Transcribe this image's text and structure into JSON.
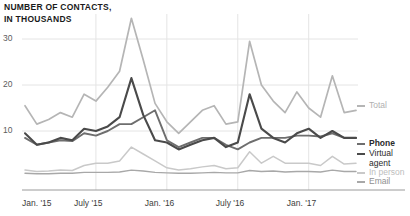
{
  "chart_data": {
    "type": "line",
    "title": "NUMBER OF CONTACTS,\nIN THOUSANDS",
    "xlabel": "",
    "ylabel": "",
    "grid": true,
    "legend_position": "right",
    "ylim": [
      0,
      36
    ],
    "yticks": [
      10,
      20,
      30
    ],
    "ytick_labels": [
      "10",
      "20",
      "30"
    ],
    "xtick_labels": [
      "Jan. '15",
      "July '15",
      "Jan. '16",
      "July '16",
      "Jan. '17"
    ],
    "xtick_indices": [
      0,
      6,
      12,
      18,
      24
    ],
    "x": [
      "Jan. '15",
      "Feb. '15",
      "Mar. '15",
      "Apr. '15",
      "May '15",
      "June '15",
      "July '15",
      "Aug. '15",
      "Sept. '15",
      "Oct. '15",
      "Nov. '15",
      "Dec. '15",
      "Jan. '16",
      "Feb. '16",
      "Mar. '16",
      "Apr. '16",
      "May '16",
      "June '16",
      "July '16",
      "Aug. '16",
      "Sept. '16",
      "Oct. '16",
      "Nov. '16",
      "Dec. '16",
      "Jan. '17",
      "Feb. '17",
      "Mar. '17",
      "Apr. '17",
      "May '17"
    ],
    "series": [
      {
        "name": "Total",
        "color": "#b5b5b5",
        "width": 1.7,
        "values": [
          15.5,
          11.5,
          12.5,
          14.0,
          13.0,
          18.0,
          16.5,
          19.5,
          23.0,
          34.5,
          25.5,
          16.0,
          12.0,
          9.5,
          12.0,
          14.5,
          15.5,
          11.5,
          12.0,
          29.5,
          20.0,
          16.5,
          14.0,
          18.5,
          15.0,
          13.0,
          22.0,
          14.0,
          14.5
        ]
      },
      {
        "name": "Phone",
        "color": "#6e6e6e",
        "width": 1.9,
        "values": [
          8.5,
          7.0,
          7.5,
          8.0,
          7.8,
          9.5,
          9.0,
          10.0,
          11.5,
          11.5,
          13.0,
          14.5,
          8.0,
          6.5,
          7.5,
          8.5,
          8.5,
          7.0,
          6.0,
          7.5,
          8.5,
          8.5,
          8.5,
          9.0,
          9.0,
          8.8,
          9.5,
          8.5,
          8.5
        ]
      },
      {
        "name": "Virtual\nagent",
        "color": "#4a4a4a",
        "width": 2.1,
        "values": [
          9.5,
          7.0,
          7.5,
          8.5,
          8.0,
          10.5,
          10.0,
          11.0,
          13.0,
          21.5,
          13.5,
          8.0,
          7.5,
          6.0,
          7.0,
          8.0,
          8.5,
          6.5,
          7.5,
          18.0,
          10.5,
          8.5,
          7.5,
          9.5,
          10.5,
          8.5,
          10.0,
          8.5,
          8.5
        ]
      },
      {
        "name": "In person",
        "color": "#c9c9c9",
        "width": 1.5,
        "values": [
          1.5,
          1.2,
          1.3,
          1.5,
          1.4,
          2.5,
          3.0,
          3.0,
          3.5,
          6.5,
          5.0,
          3.5,
          2.0,
          1.5,
          1.8,
          2.2,
          2.5,
          1.8,
          2.0,
          5.5,
          3.0,
          4.5,
          3.0,
          3.0,
          3.0,
          2.5,
          4.5,
          2.8,
          3.0
        ]
      },
      {
        "name": "Email",
        "color": "#a8a8a8",
        "width": 1.4,
        "values": [
          0.8,
          0.7,
          0.7,
          0.8,
          0.8,
          1.0,
          1.0,
          1.0,
          1.1,
          1.5,
          1.3,
          1.0,
          0.9,
          0.8,
          0.8,
          0.9,
          1.0,
          0.9,
          0.9,
          1.4,
          1.2,
          1.3,
          1.1,
          1.2,
          1.2,
          1.1,
          1.5,
          1.2,
          1.2
        ]
      }
    ]
  },
  "legend": {
    "items": [
      {
        "label": "Total",
        "color": "#b5b5b5"
      },
      {
        "label": "Phone",
        "color": "#6e6e6e"
      },
      {
        "label": "Virtual\nagent",
        "color": "#4a4a4a"
      },
      {
        "label": "In person",
        "color": "#c9c9c9"
      },
      {
        "label": "Email",
        "color": "#a8a8a8"
      }
    ]
  },
  "axis": {
    "y_labels": [
      "30",
      "20",
      "10"
    ],
    "x_labels": [
      "Jan. '15",
      "July '15",
      "Jan. '16",
      "July '16",
      "Jan. '17"
    ]
  },
  "colors": {
    "gridline": "#e4e4e4",
    "baseline": "#9a9a9a",
    "title_text": "#1a1a1a",
    "axis_text": "#5c5c5c"
  }
}
